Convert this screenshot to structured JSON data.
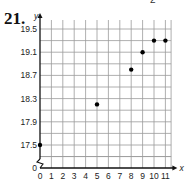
{
  "problem": {
    "number": "21.",
    "top_fragment": "2"
  },
  "chart_data": {
    "type": "scatter",
    "title": "",
    "xlabel": "x",
    "ylabel": "y",
    "x_ticks": [
      "0",
      "1",
      "2",
      "3",
      "4",
      "5",
      "6",
      "7",
      "8",
      "9",
      "10",
      "11"
    ],
    "y_ticks": [
      "0",
      "17.5",
      "17.9",
      "18.3",
      "18.7",
      "19.1",
      "19.5"
    ],
    "xlim": [
      0,
      11.5
    ],
    "ylim": [
      17.3,
      19.6
    ],
    "y_axis_break": true,
    "grid": true,
    "points": [
      {
        "x": 0,
        "y": 17.5
      },
      {
        "x": 5,
        "y": 18.2
      },
      {
        "x": 8,
        "y": 18.8
      },
      {
        "x": 9,
        "y": 19.1
      },
      {
        "x": 10,
        "y": 19.3
      },
      {
        "x": 11,
        "y": 19.3
      }
    ]
  },
  "colors": {
    "grid": "#9a9a9a",
    "axis": "#111111",
    "point": "#000000"
  }
}
